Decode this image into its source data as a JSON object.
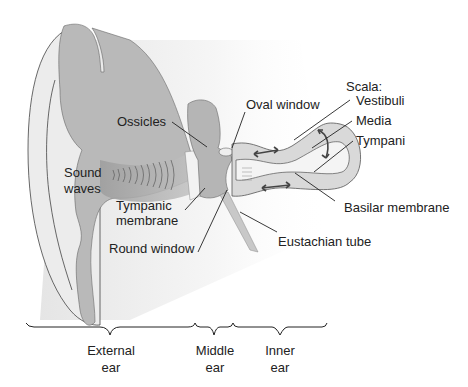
{
  "labels": {
    "ossicles": "Ossicles",
    "oval_window": "Oval window",
    "scala_heading": "Scala:",
    "vestibuli": "Vestibuli",
    "media": "Media",
    "tympani": "Tympani",
    "sound_waves_line1": "Sound",
    "sound_waves_line2": "waves",
    "tympanic_line1": "Tympanic",
    "tympanic_line2": "membrane",
    "basilar_membrane": "Basilar membrane",
    "round_window": "Round window",
    "eustachian_tube": "Eustachian tube"
  },
  "regions": [
    {
      "line1": "External",
      "line2": "ear"
    },
    {
      "line1": "Middle",
      "line2": "ear"
    },
    {
      "line1": "Inner",
      "line2": "ear"
    }
  ],
  "colors": {
    "ear_fill": "#b9b9b9",
    "outer_fill": "#e6e6e6",
    "cochlea_fill": "#d9d9d9",
    "line": "#333333"
  }
}
